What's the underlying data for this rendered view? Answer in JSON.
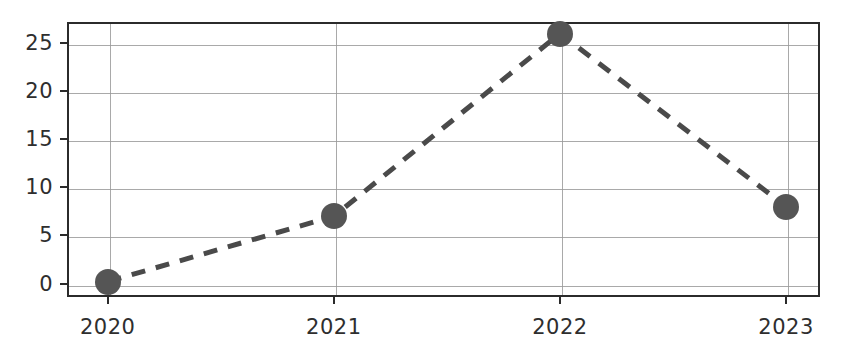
{
  "chart_data": {
    "type": "line",
    "title": "",
    "subtitle": "",
    "xlabel": "",
    "ylabel": "",
    "categories": [
      "2020",
      "2021",
      "2022",
      "2023"
    ],
    "x": [
      2020,
      2021,
      2022,
      2023
    ],
    "values": [
      0.2,
      7,
      26,
      8
    ],
    "series": [
      {
        "name": "",
        "values": [
          0.2,
          7,
          26,
          8
        ]
      }
    ],
    "xlim": [
      2019.82,
      2023.15
    ],
    "ylim": [
      -1.4,
      27.2
    ],
    "yticks": [
      0,
      5,
      10,
      15,
      20,
      25
    ],
    "ytick_labels": [
      "0",
      "5",
      "10",
      "15",
      "20",
      "25"
    ],
    "xticks": [
      2020,
      2021,
      2022,
      2023
    ],
    "xtick_labels": [
      "2020",
      "2021",
      "2022",
      "2023"
    ],
    "grid": true,
    "grid_axis": "both",
    "legend": false,
    "legend_position": "none",
    "line_style": "dashed",
    "line_width": 5,
    "marker": "circle",
    "marker_size": 26,
    "colors": {
      "line": "#4a4a4a",
      "marker": "#555555",
      "grid": "#9a9a9a",
      "spine": "#2b2b2b",
      "background": "#ffffff",
      "tick_label": "#2e2e2e"
    }
  }
}
